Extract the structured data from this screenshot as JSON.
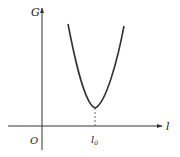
{
  "diagram": {
    "type": "function-graph",
    "y_axis": {
      "label": "G"
    },
    "x_axis": {
      "label": "l"
    },
    "origin_label": "O",
    "minimum_marker": {
      "label": "l",
      "subscript": "0"
    },
    "colors": {
      "axis": "#333333",
      "curve": "#333333",
      "dashed": "#555555"
    }
  }
}
